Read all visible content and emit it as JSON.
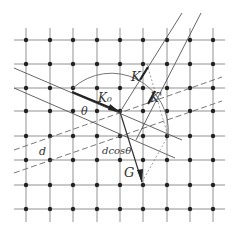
{
  "figure": {
    "labels": {
      "k0": "K₀",
      "k": "K",
      "k_prime": "K'",
      "g": "G",
      "theta": "θ",
      "d": "d",
      "dcos": "dcosθ"
    },
    "colors": {
      "line": "#555555",
      "dot": "#222222",
      "arrow": "#222222"
    },
    "grid": {
      "x": [
        26,
        50,
        73,
        97,
        120,
        143,
        167,
        190,
        213
      ],
      "y": [
        40,
        64,
        88,
        111,
        136,
        160,
        185,
        209
      ]
    }
  }
}
